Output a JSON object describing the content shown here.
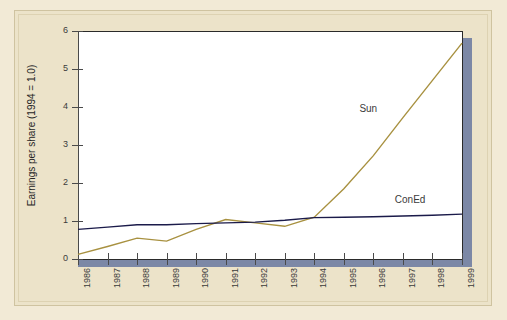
{
  "page": {
    "background_color": "#f2ead6",
    "frame_color": "#ece3c9",
    "plot_background": "#ffffff",
    "shadow_color": "#7c88a6"
  },
  "chart_data": {
    "type": "line",
    "title": "",
    "subtitle": "",
    "xlabel": "",
    "ylabel": "Earnings per share (1994 = 1.0)",
    "grid": false,
    "legend_position": "inline-annotation",
    "xlim": [
      1986,
      1999
    ],
    "ylim": [
      0,
      6
    ],
    "ytick_labels": [
      "0",
      "1",
      "2",
      "3",
      "4",
      "5",
      "6"
    ],
    "ytick_values": [
      0,
      1,
      2,
      3,
      4,
      5,
      6
    ],
    "categories": [
      "1986",
      "1987",
      "1988",
      "1989",
      "1990",
      "1991",
      "1992",
      "1993",
      "1994",
      "1995",
      "1996",
      "1997",
      "1998",
      "1999"
    ],
    "series": [
      {
        "name": "Sun",
        "color": "#a89140",
        "values": [
          0.12,
          0.33,
          0.55,
          0.47,
          0.78,
          1.04,
          0.95,
          0.86,
          1.1,
          1.85,
          2.72,
          3.72,
          4.7,
          5.68
        ]
      },
      {
        "name": "ConEd",
        "color": "#1b1b4a",
        "values": [
          0.78,
          0.84,
          0.9,
          0.9,
          0.93,
          0.95,
          0.97,
          1.02,
          1.09,
          1.1,
          1.11,
          1.13,
          1.15,
          1.18
        ]
      }
    ],
    "annotations": [
      {
        "text": "Sun",
        "x_year": 1996.0,
        "y_value": 3.95
      },
      {
        "text": "ConEd",
        "x_year": 1997.2,
        "y_value": 1.55
      }
    ]
  }
}
